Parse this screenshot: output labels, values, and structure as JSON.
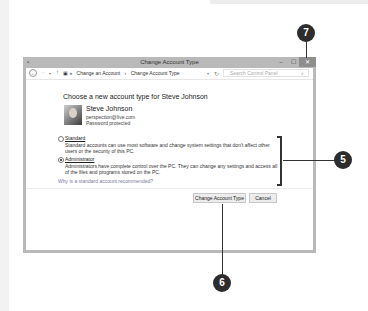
{
  "window": {
    "title": "Change Account Type",
    "controls": {
      "minimize": "–",
      "maximize": "☐",
      "close": "✕"
    }
  },
  "addressbar": {
    "back": "←",
    "forward": "→",
    "dropdown": "▾",
    "up": "↑",
    "crumbs": [
      "▣ »",
      "Change an Account",
      "›",
      "Change Account Type"
    ],
    "addr_dropdown": "▾",
    "refresh": "↻",
    "search_placeholder": "Search Control Panel",
    "search_icon": "⌕"
  },
  "content": {
    "heading": "Choose a new account type for Steve Johnson",
    "user": {
      "name": "Steve Johnson",
      "email": "perspection@live.com",
      "status": "Password protected"
    },
    "options": [
      {
        "label": "Standard",
        "checked": false,
        "description": "Standard accounts can use most software and change system settings that don't affect other users or the security of this PC."
      },
      {
        "label": "Administrator",
        "checked": true,
        "description": "Administrators have complete control over the PC. They can change any settings and access all of the files and programs stored on the PC."
      }
    ],
    "why_link": "Why is a standard account recommended?"
  },
  "buttons": {
    "change": "Change Account Type",
    "cancel": "Cancel"
  },
  "callouts": {
    "close": "7",
    "options": "5",
    "change_button": "6"
  }
}
